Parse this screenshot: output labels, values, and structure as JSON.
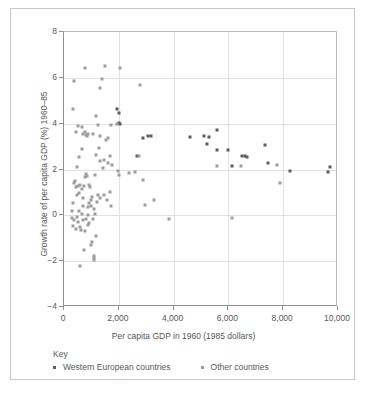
{
  "chart_data": {
    "type": "scatter",
    "title": "",
    "xlabel": "Per capita GDP in 1960 (1985 dollars)",
    "ylabel": "Growth rate of per capita GDP (%) 1960–85",
    "xlim": [
      0,
      10000
    ],
    "ylim": [
      -4,
      8
    ],
    "xticks": [
      0,
      2000,
      4000,
      6000,
      8000,
      10000
    ],
    "xticklabels": [
      "0",
      "2,000",
      "4,000",
      "6,000",
      "8,000",
      "10,000"
    ],
    "yticks": [
      -4,
      -2,
      0,
      2,
      4,
      6,
      8
    ],
    "yticklabels": [
      "−4",
      "−2",
      "0",
      "2",
      "4",
      "6",
      "8"
    ],
    "grid": true,
    "legend_position": "below-axes",
    "legend_title": "Key",
    "series": [
      {
        "name": "Western European countries",
        "color": "#5a5d61",
        "marker": "square",
        "points": [
          [
            1940,
            4.62
          ],
          [
            2010,
            4.45
          ],
          [
            1990,
            4.02
          ],
          [
            2030,
            3.99
          ],
          [
            3060,
            3.46
          ],
          [
            3180,
            3.47
          ],
          [
            4610,
            3.42
          ],
          [
            5110,
            3.45
          ],
          [
            5230,
            3.12
          ],
          [
            5290,
            3.42
          ],
          [
            5580,
            3.73
          ],
          [
            5600,
            2.87
          ],
          [
            5990,
            2.85
          ],
          [
            6130,
            2.17
          ],
          [
            6490,
            2.58
          ],
          [
            6620,
            2.58
          ],
          [
            6680,
            2.56
          ],
          [
            7350,
            3.05
          ],
          [
            7460,
            2.28
          ],
          [
            8230,
            1.95
          ],
          [
            9650,
            1.89
          ],
          [
            9710,
            2.09
          ],
          [
            2660,
            2.57
          ],
          [
            2880,
            3.37
          ]
        ]
      },
      {
        "name": "Other countries",
        "color": "#9a9da1",
        "marker": "square",
        "points": [
          [
            330,
            4.66
          ],
          [
            360,
            5.86
          ],
          [
            760,
            6.42
          ],
          [
            1510,
            6.51
          ],
          [
            2060,
            6.41
          ],
          [
            1370,
            5.95
          ],
          [
            1300,
            5.56
          ],
          [
            2790,
            5.69
          ],
          [
            420,
            3.63
          ],
          [
            520,
            3.88
          ],
          [
            660,
            3.85
          ],
          [
            700,
            3.56
          ],
          [
            760,
            3.62
          ],
          [
            800,
            3.52
          ],
          [
            830,
            3.47
          ],
          [
            880,
            3.53
          ],
          [
            1050,
            3.56
          ],
          [
            1180,
            4.33
          ],
          [
            1240,
            3.94
          ],
          [
            1300,
            3.45
          ],
          [
            1540,
            3.28
          ],
          [
            1610,
            3.38
          ],
          [
            1720,
            3.93
          ],
          [
            1950,
            3.97
          ],
          [
            2600,
            1.88
          ],
          [
            2380,
            1.85
          ],
          [
            2000,
            1.74
          ],
          [
            1960,
            1.95
          ],
          [
            1770,
            2.19
          ],
          [
            1690,
            2.57
          ],
          [
            1600,
            2.28
          ],
          [
            1450,
            2.41
          ],
          [
            1420,
            2.07
          ],
          [
            1330,
            2.35
          ],
          [
            1280,
            2.95
          ],
          [
            1180,
            2.62
          ],
          [
            640,
            2.88
          ],
          [
            560,
            2.55
          ],
          [
            480,
            2.11
          ],
          [
            400,
            1.52
          ],
          [
            360,
            1.39
          ],
          [
            330,
            0.52
          ],
          [
            300,
            0.2
          ],
          [
            430,
            1.23
          ],
          [
            470,
            0.88
          ],
          [
            520,
            1.27
          ],
          [
            560,
            0.96
          ],
          [
            600,
            1.33
          ],
          [
            640,
            1.16
          ],
          [
            680,
            0.74
          ],
          [
            720,
            1.28
          ],
          [
            760,
            1.67
          ],
          [
            800,
            1.79
          ],
          [
            840,
            1.72
          ],
          [
            880,
            0.37
          ],
          [
            920,
            1.33
          ],
          [
            960,
            1.25
          ],
          [
            1000,
            0.67
          ],
          [
            1040,
            0.82
          ],
          [
            1080,
            0.29
          ],
          [
            1130,
            1.75
          ],
          [
            1190,
            0.58
          ],
          [
            1240,
            0.88
          ],
          [
            1330,
            0.77
          ],
          [
            1470,
            0.9
          ],
          [
            1570,
            0.66
          ],
          [
            1680,
            1.02
          ],
          [
            1720,
            0.41
          ],
          [
            2870,
            1.55
          ],
          [
            2720,
            2.57
          ],
          [
            3300,
            0.66
          ],
          [
            2960,
            0.44
          ],
          [
            5590,
            2.17
          ],
          [
            6470,
            2.17
          ],
          [
            7890,
            1.42
          ],
          [
            7760,
            2.19
          ],
          [
            3840,
            -0.14
          ],
          [
            6130,
            -0.1
          ],
          [
            300,
            -0.1
          ],
          [
            340,
            -0.45
          ],
          [
            380,
            -0.22
          ],
          [
            420,
            -0.58
          ],
          [
            460,
            -0.07
          ],
          [
            500,
            -0.3
          ],
          [
            540,
            0.17
          ],
          [
            580,
            -0.52
          ],
          [
            620,
            -0.65
          ],
          [
            680,
            -0.2
          ],
          [
            720,
            -1.5
          ],
          [
            760,
            -0.7
          ],
          [
            800,
            -0.15
          ],
          [
            860,
            -0.42
          ],
          [
            920,
            -0.35
          ],
          [
            980,
            -1.28
          ],
          [
            1020,
            -1.18
          ],
          [
            1060,
            -0.17
          ],
          [
            1180,
            -0.88
          ],
          [
            1090,
            -1.85
          ],
          [
            1100,
            -1.95
          ],
          [
            1110,
            -1.78
          ],
          [
            580,
            -2.22
          ],
          [
            1000,
            0.42
          ],
          [
            1140,
            0.05
          ],
          [
            900,
            0.55
          ],
          [
            870,
            0.02
          ],
          [
            690,
            0.4
          ],
          [
            640,
            0.08
          ]
        ]
      }
    ]
  }
}
